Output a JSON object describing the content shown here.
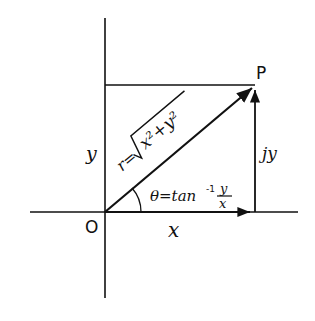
{
  "diagram": {
    "point_label": "P",
    "origin_label": "O",
    "x_label": "x",
    "y_label": "y",
    "imag_label": "jy",
    "r_prefix": "r=",
    "r_radicand": "x²+y²",
    "theta_prefix": "θ=tan",
    "theta_exp": "-1",
    "theta_num": "y",
    "theta_den": "x",
    "stroke_color": "#111111",
    "background": "#ffffff"
  }
}
